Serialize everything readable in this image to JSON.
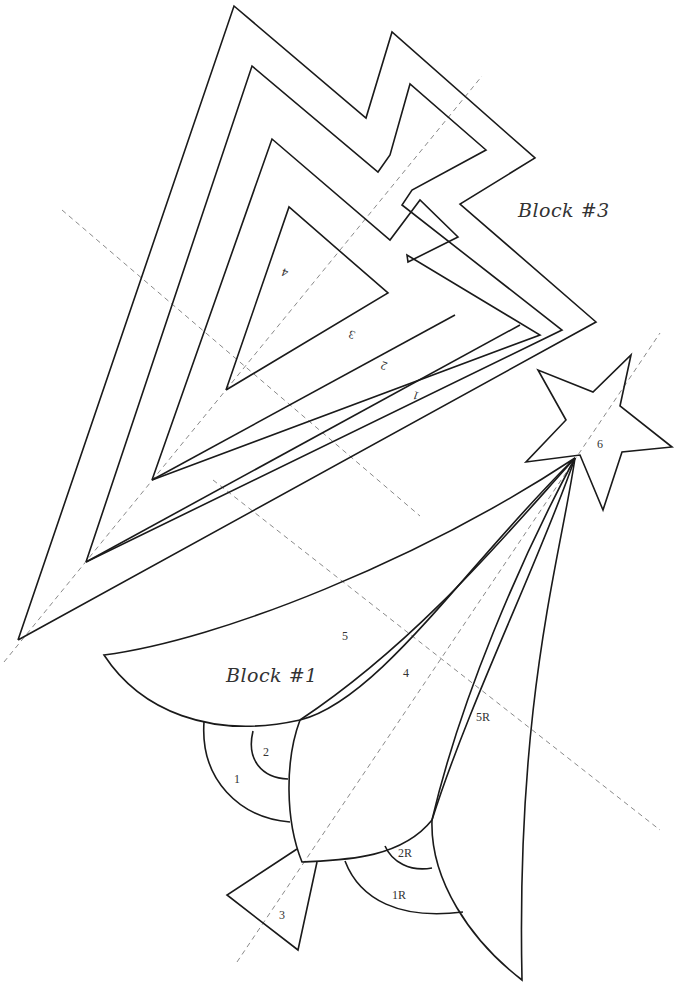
{
  "pattern": {
    "title": "Shooting Star Paper Piecing Pattern",
    "blocks": [
      {
        "id": "block-3",
        "label": "Block #3",
        "pieces": [
          {
            "num": "1",
            "rotated": true
          },
          {
            "num": "2",
            "rotated": true
          },
          {
            "num": "3",
            "rotated": true
          },
          {
            "num": "4",
            "rotated": true
          }
        ]
      },
      {
        "id": "block-1",
        "label": "Block #1",
        "pieces": [
          {
            "num": "1"
          },
          {
            "num": "2"
          },
          {
            "num": "3"
          },
          {
            "num": "4"
          },
          {
            "num": "5"
          },
          {
            "num": "5R"
          },
          {
            "num": "2R"
          },
          {
            "num": "1R"
          },
          {
            "num": "6"
          }
        ]
      }
    ],
    "colors": {
      "line": "#1a1a1a",
      "guide": "#8a8a8a",
      "text": "#333333",
      "background": "#ffffff"
    }
  }
}
